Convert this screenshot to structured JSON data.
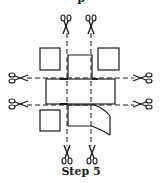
{
  "diagram": {
    "caption": "Step 5",
    "top_partial_caption": "p",
    "stroke_color": "#1a1a1a",
    "elements": {
      "scissors_count": 8,
      "squares": [
        "top-left",
        "top-right",
        "bottom-left"
      ],
      "cross_shape": "plus-shaped box net with one flap peeled back",
      "cut_lines": [
        "vertical-left",
        "vertical-right",
        "horizontal-top",
        "horizontal-bottom"
      ]
    }
  }
}
